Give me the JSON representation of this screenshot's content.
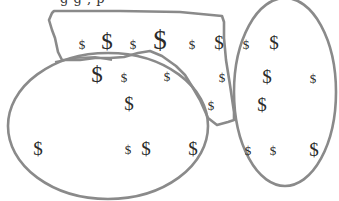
{
  "caption": {
    "text": "g            g ,          p"
  },
  "colors": {
    "outline": "#8a8a8a",
    "symbol": "#2a2a2a",
    "background": "#ffffff"
  },
  "regions": [
    {
      "name": "freeform-region",
      "shape": "freeform"
    },
    {
      "name": "left-ellipse",
      "shape": "ellipse",
      "cx": 108,
      "cy": 126,
      "rx": 100,
      "ry": 73
    },
    {
      "name": "right-ellipse",
      "shape": "ellipse",
      "cx": 285,
      "cy": 92,
      "rx": 51,
      "ry": 94
    }
  ],
  "symbols": [
    {
      "glyph": "$",
      "x": 82,
      "y": 44,
      "size": "sm"
    },
    {
      "glyph": "$",
      "x": 107,
      "y": 41,
      "size": "lg"
    },
    {
      "glyph": "$",
      "x": 133,
      "y": 44,
      "size": "sm"
    },
    {
      "glyph": "$",
      "x": 160,
      "y": 40,
      "size": "xl"
    },
    {
      "glyph": "$",
      "x": 192,
      "y": 44,
      "size": "sm"
    },
    {
      "glyph": "$",
      "x": 219,
      "y": 42,
      "size": "md"
    },
    {
      "glyph": "$",
      "x": 246,
      "y": 44,
      "size": "sm"
    },
    {
      "glyph": "$",
      "x": 274,
      "y": 42,
      "size": "md"
    },
    {
      "glyph": "$",
      "x": 97,
      "y": 74,
      "size": "lg"
    },
    {
      "glyph": "$",
      "x": 124,
      "y": 77,
      "size": "sm"
    },
    {
      "glyph": "$",
      "x": 167,
      "y": 76,
      "size": "sm"
    },
    {
      "glyph": "$",
      "x": 222,
      "y": 77,
      "size": "sm"
    },
    {
      "glyph": "$",
      "x": 267,
      "y": 76,
      "size": "md"
    },
    {
      "glyph": "$",
      "x": 313,
      "y": 78,
      "size": "sm"
    },
    {
      "glyph": "$",
      "x": 129,
      "y": 103,
      "size": "md"
    },
    {
      "glyph": "$",
      "x": 211,
      "y": 105,
      "size": "sm"
    },
    {
      "glyph": "$",
      "x": 262,
      "y": 104,
      "size": "md"
    },
    {
      "glyph": "$",
      "x": 38,
      "y": 148,
      "size": "md"
    },
    {
      "glyph": "$",
      "x": 128,
      "y": 149,
      "size": "sm"
    },
    {
      "glyph": "$",
      "x": 146,
      "y": 148,
      "size": "md"
    },
    {
      "glyph": "$",
      "x": 193,
      "y": 148,
      "size": "md"
    },
    {
      "glyph": "$",
      "x": 248,
      "y": 150,
      "size": "sm"
    },
    {
      "glyph": "$",
      "x": 273,
      "y": 150,
      "size": "sm"
    },
    {
      "glyph": "$",
      "x": 314,
      "y": 149,
      "size": "md"
    }
  ]
}
